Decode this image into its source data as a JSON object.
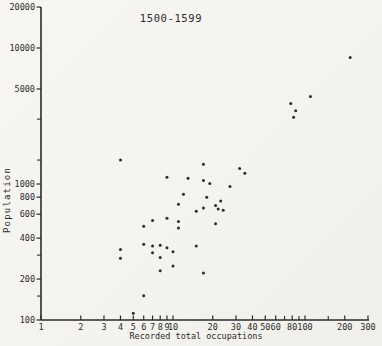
{
  "chart_data": {
    "type": "scatter",
    "title": "1500-1599",
    "xlabel": "Recorded total occupations",
    "ylabel": "Population",
    "x_scale": "log",
    "y_scale": "log",
    "xlim": [
      1,
      300
    ],
    "ylim": [
      100,
      20000
    ],
    "grid": false,
    "legend": "none",
    "x_ticks": [
      1,
      2,
      3,
      4,
      5,
      6,
      7,
      8,
      9,
      10,
      20,
      30,
      40,
      50,
      60,
      80,
      100,
      200,
      300
    ],
    "x_minor_ticks": [
      70,
      90,
      150
    ],
    "y_ticks": [
      100,
      200,
      400,
      600,
      800,
      1000,
      5000,
      10000,
      20000
    ],
    "y_minor_ticks": [
      150,
      300,
      1500,
      3000
    ],
    "points": [
      [
        220,
        8500
      ],
      [
        110,
        4400
      ],
      [
        78,
        3900
      ],
      [
        85,
        3450
      ],
      [
        82,
        3100
      ],
      [
        4,
        1500
      ],
      [
        17,
        1400
      ],
      [
        32,
        1300
      ],
      [
        35,
        1200
      ],
      [
        9,
        1120
      ],
      [
        13,
        1100
      ],
      [
        17,
        1060
      ],
      [
        19,
        1010
      ],
      [
        27,
        960
      ],
      [
        12,
        840
      ],
      [
        18,
        800
      ],
      [
        23,
        750
      ],
      [
        11,
        710
      ],
      [
        21,
        695
      ],
      [
        17,
        665
      ],
      [
        22,
        655
      ],
      [
        24,
        640
      ],
      [
        15,
        630
      ],
      [
        9,
        560
      ],
      [
        7,
        540
      ],
      [
        11,
        530
      ],
      [
        21,
        510
      ],
      [
        6,
        490
      ],
      [
        11,
        475
      ],
      [
        6,
        360
      ],
      [
        8,
        355
      ],
      [
        7,
        350
      ],
      [
        15,
        350
      ],
      [
        9,
        340
      ],
      [
        4,
        330
      ],
      [
        10,
        318
      ],
      [
        7,
        312
      ],
      [
        8,
        288
      ],
      [
        4,
        285
      ],
      [
        10,
        250
      ],
      [
        8,
        230
      ],
      [
        17,
        222
      ],
      [
        6,
        151
      ],
      [
        5,
        112
      ]
    ]
  },
  "colors": {
    "ink": "#2b2b2b",
    "paper": "#f6f5f2"
  }
}
